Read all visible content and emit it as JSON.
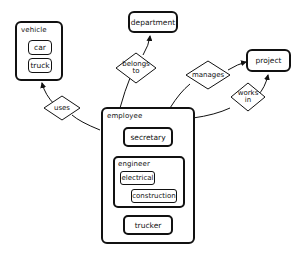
{
  "diagram": {
    "type": "entity-relationship",
    "entities": {
      "vehicle": {
        "label": "vehicle",
        "subtypes": [
          "car",
          "truck"
        ]
      },
      "department": {
        "label": "department"
      },
      "project": {
        "label": "project"
      },
      "employee": {
        "label": "employee",
        "subtypes": {
          "secretary": {
            "label": "secretary"
          },
          "engineer": {
            "label": "engineer",
            "subtypes": [
              "electrical",
              "construction"
            ]
          },
          "trucker": {
            "label": "trucker"
          }
        }
      }
    },
    "relationships": {
      "uses": {
        "line1": "uses",
        "line2": ""
      },
      "belongs_to": {
        "line1": "belongs",
        "line2": "to"
      },
      "manages": {
        "line1": "manages",
        "line2": ""
      },
      "works_in": {
        "line1": "works",
        "line2": "in"
      }
    },
    "edges": [
      {
        "from": "employee",
        "via": "uses",
        "to": "vehicle"
      },
      {
        "from": "employee",
        "via": "belongs to",
        "to": "department"
      },
      {
        "from": "employee",
        "via": "manages",
        "to": "project"
      },
      {
        "from": "employee",
        "via": "works in",
        "to": "project"
      }
    ]
  }
}
